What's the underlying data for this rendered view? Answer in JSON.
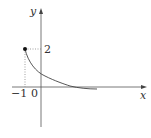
{
  "figure": {
    "axes": {
      "x_label": "x",
      "y_label": "y",
      "origin_label": "0"
    },
    "ticks": {
      "x_tick": "−1",
      "y_tick": "2"
    },
    "point": {
      "x": -1,
      "y": 2,
      "filled": true
    },
    "curve": "decreasing curve from (−1, 2) approaching the x-axis as x increases",
    "colors": {
      "stroke": "#444444",
      "guide": "#777777"
    }
  }
}
